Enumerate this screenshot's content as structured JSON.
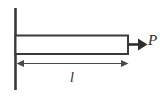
{
  "figure": {
    "background_color": "#ffffff",
    "line_color": "#3a3a3a",
    "dim_line_color": "#4a4a4a",
    "text_color": "#2b2b2b",
    "width": 165,
    "height": 97
  },
  "labels": {
    "force": "P",
    "length": "l"
  },
  "elements": {
    "wall_name": "fixed support wall",
    "bar_name": "rectangular bar",
    "force_arrow_name": "axial tensile force arrow",
    "dimension_name": "length dimension line"
  },
  "geometry": {
    "wall_x": 15,
    "wall_top": 8,
    "wall_bottom": 90,
    "bar_left": 15,
    "bar_right": 128,
    "bar_top": 35,
    "bar_bottom": 54,
    "force_arrow_y": 44,
    "force_arrow_tip_x": 147,
    "dim_line_y": 63,
    "dim_left_x": 17,
    "dim_right_x": 128
  }
}
